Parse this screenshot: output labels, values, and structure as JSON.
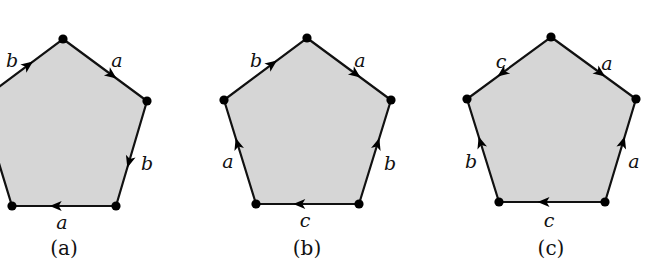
{
  "figure": {
    "background": "#ffffff",
    "fill_color": "#d6d6d6",
    "stroke_color": "#111111",
    "panels": [
      {
        "id": "a",
        "caption": "(a)",
        "vertices": [
          [
            63,
            39
          ],
          [
            147,
            101
          ],
          [
            116,
            206
          ],
          [
            12,
            206
          ],
          [
            -20,
            101
          ]
        ],
        "edges": [
          {
            "label": "a",
            "from": 0,
            "to": 1,
            "direction": "forward",
            "label_pos": [
              117,
              62
            ]
          },
          {
            "label": "b",
            "from": 1,
            "to": 2,
            "direction": "forward",
            "label_pos": [
              147,
              165
            ]
          },
          {
            "label": "a",
            "from": 2,
            "to": 3,
            "direction": "forward",
            "label_pos": [
              62,
              224
            ]
          },
          {
            "label": "",
            "from": 3,
            "to": 4,
            "direction": "none",
            "label_pos": [
              0,
              0
            ]
          },
          {
            "label": "b",
            "from": 4,
            "to": 0,
            "direction": "forward",
            "label_pos": [
              12,
              62
            ]
          }
        ],
        "caption_pos": [
          64,
          255
        ]
      },
      {
        "id": "b",
        "caption": "(b)",
        "vertices": [
          [
            307,
            38
          ],
          [
            391,
            100
          ],
          [
            359,
            204
          ],
          [
            256,
            204
          ],
          [
            224,
            100
          ]
        ],
        "edges": [
          {
            "label": "a",
            "from": 0,
            "to": 1,
            "direction": "forward",
            "label_pos": [
              360,
              62
            ]
          },
          {
            "label": "b",
            "from": 2,
            "to": 1,
            "direction": "forward",
            "label_pos": [
              390,
              165
            ]
          },
          {
            "label": "c",
            "from": 2,
            "to": 3,
            "direction": "forward",
            "label_pos": [
              305,
              222
            ]
          },
          {
            "label": "a",
            "from": 3,
            "to": 4,
            "direction": "forward",
            "label_pos": [
              228,
              163
            ]
          },
          {
            "label": "b",
            "from": 4,
            "to": 0,
            "direction": "forward",
            "label_pos": [
              256,
              62
            ]
          }
        ],
        "caption_pos": [
          307,
          255
        ]
      },
      {
        "id": "c",
        "caption": "(c)",
        "vertices": [
          [
            551,
            37
          ],
          [
            636,
            99
          ],
          [
            605,
            202
          ],
          [
            499,
            202
          ],
          [
            467,
            99
          ]
        ],
        "edges": [
          {
            "label": "a",
            "from": 0,
            "to": 1,
            "direction": "forward",
            "label_pos": [
              607,
              65
            ]
          },
          {
            "label": "a",
            "from": 2,
            "to": 1,
            "direction": "forward",
            "label_pos": [
              634,
              163
            ]
          },
          {
            "label": "c",
            "from": 2,
            "to": 3,
            "direction": "forward",
            "label_pos": [
              549,
              222
            ]
          },
          {
            "label": "b",
            "from": 3,
            "to": 4,
            "direction": "forward",
            "label_pos": [
              471,
              163
            ]
          },
          {
            "label": "c",
            "from": 0,
            "to": 4,
            "direction": "forward",
            "label_pos": [
              501,
              63
            ]
          }
        ],
        "caption_pos": [
          551,
          255
        ]
      }
    ]
  }
}
